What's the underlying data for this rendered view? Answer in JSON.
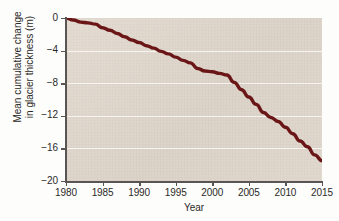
{
  "chart_data": {
    "type": "line",
    "title": "",
    "xlabel": "Year",
    "ylabel": "Mean cumulative change\nin glacier thickness (m)",
    "ylabel_line1": "Mean cumulative change",
    "ylabel_line2": "in glacier thickness (m)",
    "xlim": [
      1980,
      2015
    ],
    "ylim": [
      -20,
      0
    ],
    "xticks": [
      1980,
      1985,
      1990,
      1995,
      2000,
      2005,
      2010,
      2015
    ],
    "xtick_labels": [
      "1980",
      "1985",
      "1990",
      "1995",
      "2000",
      "2005",
      "2010",
      "2015"
    ],
    "yticks": [
      0,
      -4,
      -8,
      -12,
      -16,
      -20
    ],
    "ytick_labels": [
      "0",
      "−4",
      "−8",
      "−12",
      "−16",
      "−20"
    ],
    "grid": "horizontal",
    "gridlines_at": [
      -4,
      -8,
      -12,
      -16
    ],
    "legend": "none",
    "series": [
      {
        "name": "Mean cumulative change in glacier thickness",
        "color": "#6b1616",
        "line_width": 3.4,
        "x": [
          1980,
          1981,
          1982,
          1983,
          1984,
          1985,
          1986,
          1987,
          1988,
          1989,
          1990,
          1991,
          1992,
          1993,
          1994,
          1995,
          1996,
          1997,
          1998,
          1999,
          2000,
          2001,
          2002,
          2003,
          2004,
          2005,
          2006,
          2007,
          2008,
          2009,
          2010,
          2011,
          2012,
          2013,
          2014,
          2015
        ],
        "values": [
          0.0,
          -0.25,
          -0.5,
          -0.6,
          -0.75,
          -1.2,
          -1.5,
          -1.9,
          -2.3,
          -2.7,
          -3.0,
          -3.4,
          -3.7,
          -4.1,
          -4.4,
          -4.8,
          -5.2,
          -5.5,
          -6.2,
          -6.5,
          -6.6,
          -6.8,
          -7.0,
          -7.9,
          -8.8,
          -9.7,
          -10.6,
          -11.6,
          -12.2,
          -12.7,
          -13.4,
          -14.2,
          -15.1,
          -15.8,
          -16.8,
          -17.5
        ]
      }
    ]
  },
  "figure": {
    "plot_background_color": "#ded6cb",
    "page_background_color": "#fdfdfc",
    "axis_color": "#585552",
    "gridline_color": "#ffffff"
  }
}
